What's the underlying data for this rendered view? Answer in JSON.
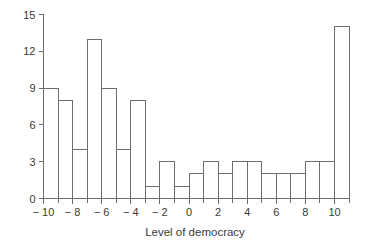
{
  "chart_data": {
    "type": "bar",
    "title": "",
    "subtitle": "",
    "xlabel": "Level of democracy",
    "ylabel": "",
    "xlim": [
      -10.6,
      11.4
    ],
    "ylim": [
      0,
      15
    ],
    "grid": false,
    "legend": null,
    "bin_width": 1,
    "bin_edges": [
      -10,
      -9,
      -8,
      -7,
      -6,
      -5,
      -4,
      -3,
      -2,
      -1,
      0,
      1,
      2,
      3,
      4,
      5,
      6,
      7,
      8,
      9,
      10,
      11
    ],
    "categories": [
      "-10 to -9",
      "-9 to -8",
      "-8 to -7",
      "-7 to -6",
      "-6 to -5",
      "-5 to -4",
      "-4 to -3",
      "-3 to -2",
      "-2 to -1",
      "-1 to 0",
      "0 to 1",
      "1 to 2",
      "2 to 3",
      "3 to 4",
      "4 to 5",
      "5 to 6",
      "6 to 7",
      "7 to 8",
      "8 to 9",
      "9 to 10",
      "10 to 11"
    ],
    "values": [
      9,
      8,
      4,
      13,
      9,
      4,
      8,
      1,
      3,
      1,
      2,
      3,
      2,
      3,
      3,
      2,
      2,
      2,
      3,
      3,
      14
    ],
    "x_ticks_major": [
      -10,
      -8,
      -6,
      -4,
      -2,
      0,
      2,
      4,
      6,
      8,
      10
    ],
    "x_tick_labels": [
      "− 10",
      "− 8",
      "− 6",
      "− 4",
      "− 2",
      "0",
      "2",
      "4",
      "6",
      "8",
      "10"
    ],
    "x_ticks_minor": [
      -9,
      -7,
      -5,
      -3,
      -1,
      1,
      3,
      5,
      7,
      9,
      11
    ],
    "y_ticks": [
      0,
      3,
      6,
      9,
      12,
      15
    ],
    "y_tick_labels": [
      "0",
      "3",
      "6",
      "9",
      "12",
      "15"
    ],
    "colors": {
      "bar_stroke": "#6e6e6e",
      "bar_fill": "none",
      "axis": "#6e6e6e",
      "text": "#3a3a3a",
      "background": "#ffffff"
    }
  }
}
